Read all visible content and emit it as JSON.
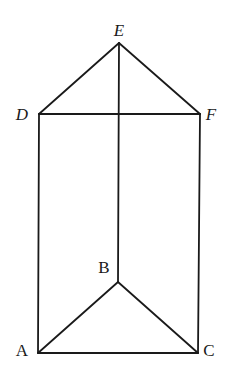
{
  "vertices": {
    "A": {
      "label": "A",
      "x": 38,
      "y": 353,
      "lx": 22,
      "ly": 356,
      "italic": false
    },
    "B": {
      "label": "B",
      "x": 118,
      "y": 282,
      "lx": 104,
      "ly": 273,
      "italic": false
    },
    "C": {
      "label": "C",
      "x": 198,
      "y": 353,
      "lx": 209,
      "ly": 356,
      "italic": false
    },
    "D": {
      "label": "D",
      "x": 39,
      "y": 114,
      "lx": 22,
      "ly": 120,
      "italic": true
    },
    "E": {
      "label": "E",
      "x": 119,
      "y": 43,
      "lx": 119,
      "ly": 36,
      "italic": true
    },
    "F": {
      "label": "F",
      "x": 200,
      "y": 114,
      "lx": 211,
      "ly": 120,
      "italic": true
    }
  },
  "edges": [
    {
      "from": "A",
      "to": "B"
    },
    {
      "from": "B",
      "to": "C"
    },
    {
      "from": "A",
      "to": "C"
    },
    {
      "from": "D",
      "to": "E"
    },
    {
      "from": "E",
      "to": "F"
    },
    {
      "from": "D",
      "to": "F"
    },
    {
      "from": "A",
      "to": "D"
    },
    {
      "from": "B",
      "to": "E"
    },
    {
      "from": "C",
      "to": "F"
    }
  ],
  "colors": {
    "stroke": "#1a1a1a",
    "background": "#ffffff"
  }
}
